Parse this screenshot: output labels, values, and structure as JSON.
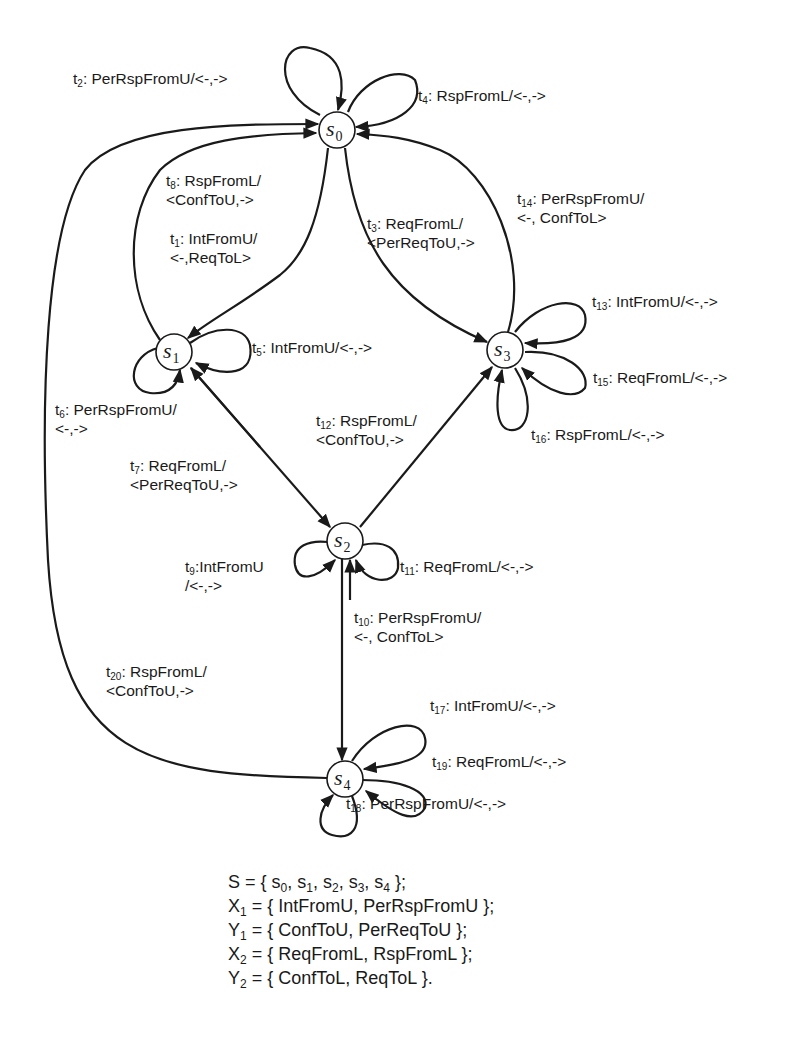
{
  "diagram": {
    "type": "finite-state-machine",
    "states": [
      {
        "id": "s0",
        "letter": "s",
        "index": "0"
      },
      {
        "id": "s1",
        "letter": "s",
        "index": "1"
      },
      {
        "id": "s2",
        "letter": "s",
        "index": "2"
      },
      {
        "id": "s3",
        "letter": "s",
        "index": "3"
      },
      {
        "id": "s4",
        "letter": "s",
        "index": "4"
      }
    ],
    "transitions": [
      {
        "id": "t1",
        "num": "1",
        "from": "s0",
        "to": "s1",
        "line1": ": IntFromU/",
        "line2": "<-,ReqToL>"
      },
      {
        "id": "t2",
        "num": "2",
        "from": "s0",
        "to": "s0",
        "line1": ": PerRspFromU/<-,->",
        "line2": ""
      },
      {
        "id": "t3",
        "num": "3",
        "from": "s0",
        "to": "s3",
        "line1": ": ReqFromL/",
        "line2": "<PerReqToU,->"
      },
      {
        "id": "t4",
        "num": "4",
        "from": "s0",
        "to": "s0",
        "line1": ": RspFromL/<-,->",
        "line2": ""
      },
      {
        "id": "t5",
        "num": "5",
        "from": "s1",
        "to": "s1",
        "line1": ": IntFromU/<-,->",
        "line2": ""
      },
      {
        "id": "t6",
        "num": "6",
        "from": "s1",
        "to": "s1",
        "line1": ": PerRspFromU/",
        "line2": "<-,->"
      },
      {
        "id": "t7",
        "num": "7",
        "from": "s1",
        "to": "s2",
        "line1": ": ReqFromL/",
        "line2": "<PerReqToU,->"
      },
      {
        "id": "t8",
        "num": "8",
        "from": "s1",
        "to": "s0",
        "line1": ": RspFromL/",
        "line2": "<ConfToU,->"
      },
      {
        "id": "t9",
        "num": "9",
        "from": "s2",
        "to": "s2",
        "line1": ":IntFromU",
        "line2": "/<-,->"
      },
      {
        "id": "t10",
        "num": "10",
        "from": "s2",
        "to": "s4",
        "line1": ": PerRspFromU/",
        "line2": "<-, ConfToL>"
      },
      {
        "id": "t11",
        "num": "11",
        "from": "s2",
        "to": "s2",
        "line1": ": ReqFromL/<-,->",
        "line2": ""
      },
      {
        "id": "t12",
        "num": "12",
        "from": "s2",
        "to": "s3",
        "line1": ": RspFromL/",
        "line2": "<ConfToU,->"
      },
      {
        "id": "t13",
        "num": "13",
        "from": "s3",
        "to": "s3",
        "line1": ": IntFromU/<-,->",
        "line2": ""
      },
      {
        "id": "t14",
        "num": "14",
        "from": "s3",
        "to": "s0",
        "line1": ": PerRspFromU/",
        "line2": "<-, ConfToL>"
      },
      {
        "id": "t15",
        "num": "15",
        "from": "s3",
        "to": "s3",
        "line1": ": ReqFromL/<-,->",
        "line2": ""
      },
      {
        "id": "t16",
        "num": "16",
        "from": "s3",
        "to": "s3",
        "line1": ": RspFromL/<-,->",
        "line2": ""
      },
      {
        "id": "t17",
        "num": "17",
        "from": "s4",
        "to": "s4",
        "line1": ": IntFromU/<-,->",
        "line2": ""
      },
      {
        "id": "t18",
        "num": "18",
        "from": "s4",
        "to": "s4",
        "line1": ": PerRspFromU/<-,->",
        "line2": ""
      },
      {
        "id": "t19",
        "num": "19",
        "from": "s4",
        "to": "s4",
        "line1": ": ReqFromL/<-,->",
        "line2": ""
      },
      {
        "id": "t20",
        "num": "20",
        "from": "s4",
        "to": "s0",
        "line1": ": RspFromL/",
        "line2": "<ConfToU,->"
      }
    ]
  },
  "definitions": {
    "S": {
      "name": "S",
      "sub": "",
      "eq": " = { ",
      "items": "s",
      "rest": ""
    },
    "S_line": {
      "prefix": "S = { ",
      "s0": "s",
      "i0": "0",
      "s1": ", s",
      "i1": "1",
      "s2": ", s",
      "i2": "2",
      "s3": ", s",
      "i3": "3",
      "s4": ", s",
      "i4": "4",
      "suffix": " };"
    },
    "X1": {
      "name": "X",
      "sub": "1",
      "body": " = { IntFromU, PerRspFromU };"
    },
    "Y1": {
      "name": "Y",
      "sub": "1",
      "body": " = { ConfToU, PerReqToU };"
    },
    "X2": {
      "name": "X",
      "sub": "2",
      "body": " = { ReqFromL, RspFromL };"
    },
    "Y2": {
      "name": "Y",
      "sub": "2",
      "body": " = { ConfToL, ReqToL }."
    }
  }
}
